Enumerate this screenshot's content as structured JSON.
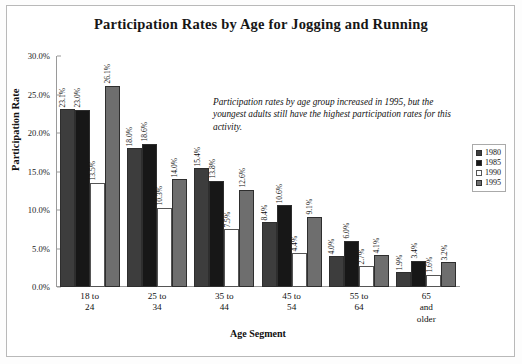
{
  "chart_data": {
    "type": "bar",
    "title": "Participation Rates by Age for Jogging and Running",
    "xlabel": "Age Segment",
    "ylabel": "Participation Rate",
    "ylim": [
      0,
      30
    ],
    "ytick_labels": [
      "0.0%",
      "5.0%",
      "10.0%",
      "15.0%",
      "20.0%",
      "25.0%",
      "30.0%"
    ],
    "ytick_values": [
      0,
      5,
      10,
      15,
      20,
      25,
      30
    ],
    "grid": false,
    "legend_position": "right",
    "categories": [
      "18 to 24",
      "25 to 34",
      "35 to 44",
      "45 to 54",
      "55 to 64",
      "65 and older"
    ],
    "category_lines": [
      [
        "18 to",
        "24"
      ],
      [
        "25 to",
        "34"
      ],
      [
        "35 to",
        "44"
      ],
      [
        "45 to",
        "54"
      ],
      [
        "55 to",
        "64"
      ],
      [
        "65",
        "and",
        "older"
      ]
    ],
    "series": [
      {
        "name": "1980",
        "color": "#3d3d3d",
        "values": [
          23.1,
          18.0,
          15.4,
          8.4,
          4.0,
          1.9
        ],
        "labels": [
          "23.1%",
          "18.0%",
          "15.4%",
          "8.4%",
          "4.0%",
          "1.9%"
        ]
      },
      {
        "name": "1985",
        "color": "#171717",
        "values": [
          23.0,
          18.6,
          13.8,
          10.6,
          6.0,
          3.4
        ],
        "labels": [
          "23.0%",
          "18.6%",
          "13.8%",
          "10.6%",
          "6.0%",
          "3.4%"
        ]
      },
      {
        "name": "1990",
        "color": "#ffffff",
        "values": [
          13.5,
          10.3,
          7.5,
          4.4,
          2.7,
          1.6
        ],
        "labels": [
          "13.5%",
          "10.3%",
          "7.5%",
          "4.4%",
          "2.7%",
          "1.6%"
        ]
      },
      {
        "name": "1995",
        "color": "#6e6e6e",
        "values": [
          26.1,
          14.0,
          12.6,
          9.1,
          4.1,
          3.2
        ],
        "labels": [
          "26.1%",
          "14.0%",
          "12.6%",
          "9.1%",
          "4.1%",
          "3.2%"
        ]
      }
    ],
    "annotation": "Participation rates by age group increased in 1995, but the youngest adults still have the highest participation rates for this activity."
  }
}
